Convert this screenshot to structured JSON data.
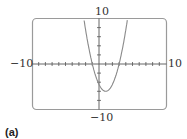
{
  "chart_data": {
    "type": "line",
    "title": "",
    "panel_label": "(a)",
    "xlabel": "",
    "ylabel": "",
    "xlim": [
      -10,
      10
    ],
    "ylim": [
      -10,
      10
    ],
    "x_tick_step": 1,
    "y_tick_step": 2,
    "grid": false,
    "tick_labels": {
      "xmin": "−10",
      "xmax": "10",
      "ymin": "−10",
      "ymax": "10"
    },
    "series": [
      {
        "name": "parabola",
        "description": "upward-opening parabola, roots near x=-1 and x=3, vertex near (1,-6)",
        "x": [
          -2.3,
          -2,
          -1.5,
          -1,
          -0.5,
          0,
          0.5,
          1,
          1.5,
          2,
          2.5,
          3,
          3.5,
          4,
          4.3
        ],
        "y": [
          9.9,
          7.5,
          4.1,
          0,
          -3.4,
          -4.5,
          -5.6,
          -6,
          -5.6,
          -4.5,
          -2.6,
          0,
          3.4,
          7.5,
          9.9
        ]
      }
    ],
    "colors": {
      "curve": "#8a8a8a",
      "frame": "#9a9a9a",
      "axes": "#555555"
    }
  }
}
